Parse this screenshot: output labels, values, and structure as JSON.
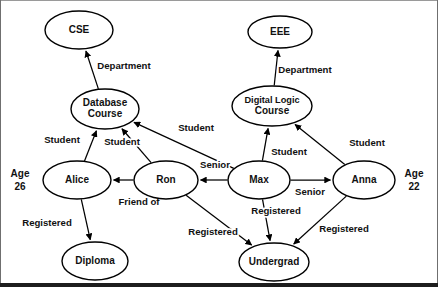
{
  "diagram": {
    "background_color": "#ffffff",
    "stroke_color": "#000000",
    "text_color": "#111111",
    "border_bottom_color": "#1d1d1d",
    "width": 438,
    "height": 298
  },
  "nodes": [
    {
      "id": "cse",
      "label": "CSE",
      "lines": [
        "CSE"
      ],
      "cx": 79,
      "cy": 30,
      "rx": 34,
      "ry": 19
    },
    {
      "id": "eee",
      "label": "EEE",
      "lines": [
        "EEE"
      ],
      "cx": 280,
      "cy": 32,
      "rx": 32,
      "ry": 16
    },
    {
      "id": "dbcourse",
      "label": "Database Course",
      "lines": [
        "Database",
        "Course"
      ],
      "cx": 105,
      "cy": 109,
      "rx": 34,
      "ry": 20
    },
    {
      "id": "dlcourse",
      "label": "Digital Logic Course",
      "lines": [
        "Digital Logic",
        "Course"
      ],
      "cx": 272,
      "cy": 106,
      "rx": 40,
      "ry": 20
    },
    {
      "id": "alice",
      "label": "Alice",
      "lines": [
        "Alice"
      ],
      "cx": 77,
      "cy": 180,
      "rx": 34,
      "ry": 19
    },
    {
      "id": "ron",
      "label": "Ron",
      "lines": [
        "Ron"
      ],
      "cx": 166,
      "cy": 180,
      "rx": 32,
      "ry": 19
    },
    {
      "id": "max",
      "label": "Max",
      "lines": [
        "Max"
      ],
      "cx": 259,
      "cy": 180,
      "rx": 31,
      "ry": 19
    },
    {
      "id": "anna",
      "label": "Anna",
      "lines": [
        "Anna"
      ],
      "cx": 364,
      "cy": 180,
      "rx": 31,
      "ry": 19
    },
    {
      "id": "diploma",
      "label": "Diploma",
      "lines": [
        "Diploma"
      ],
      "cx": 95,
      "cy": 261,
      "rx": 33,
      "ry": 19
    },
    {
      "id": "undergrad",
      "label": "Undergrad",
      "lines": [
        "Undergrad"
      ],
      "cx": 274,
      "cy": 262,
      "rx": 35,
      "ry": 19
    }
  ],
  "edges": [
    {
      "id": "e1",
      "from": "dbcourse",
      "to": "cse",
      "label": "Department",
      "label_x": 124,
      "label_y": 66,
      "directed": true
    },
    {
      "id": "e2",
      "from": "dlcourse",
      "to": "eee",
      "label": "Department",
      "label_x": 305,
      "label_y": 70,
      "directed": true
    },
    {
      "id": "e3",
      "from": "alice",
      "to": "dbcourse",
      "label": "Student",
      "label_x": 62,
      "label_y": 140,
      "directed": true
    },
    {
      "id": "e4",
      "from": "ron",
      "to": "dbcourse",
      "label": "Student",
      "label_x": 122,
      "label_y": 142,
      "directed": true
    },
    {
      "id": "e5",
      "from": "max",
      "to": "dbcourse",
      "label": "Student",
      "label_x": 196,
      "label_y": 128,
      "directed": true
    },
    {
      "id": "e6",
      "from": "max",
      "to": "dlcourse",
      "label": "Student",
      "label_x": 289,
      "label_y": 152,
      "directed": true
    },
    {
      "id": "e7",
      "from": "anna",
      "to": "dlcourse",
      "label": "Student",
      "label_x": 367,
      "label_y": 143,
      "directed": true
    },
    {
      "id": "e8",
      "from": "ron",
      "to": "alice",
      "label": "Friend of",
      "label_x": 139,
      "label_y": 202,
      "directed": true
    },
    {
      "id": "e9",
      "from": "max",
      "to": "ron",
      "label": "Senior",
      "label_x": 215,
      "label_y": 165,
      "directed": true
    },
    {
      "id": "e10",
      "from": "max",
      "to": "anna",
      "label": "Senior",
      "label_x": 310,
      "label_y": 192,
      "directed": true
    },
    {
      "id": "e11",
      "from": "alice",
      "to": "diploma",
      "label": "Registered",
      "label_x": 47,
      "label_y": 223,
      "directed": true
    },
    {
      "id": "e12",
      "from": "ron",
      "to": "undergrad",
      "label": "Registered",
      "label_x": 213,
      "label_y": 232,
      "directed": true
    },
    {
      "id": "e13",
      "from": "max",
      "to": "undergrad",
      "label": "Registered",
      "label_x": 276,
      "label_y": 211,
      "directed": true
    },
    {
      "id": "e14",
      "from": "anna",
      "to": "undergrad",
      "label": "Registered",
      "label_x": 344,
      "label_y": 229,
      "directed": true
    }
  ],
  "attributes": [
    {
      "id": "alice-age",
      "lines": [
        "Age",
        "26"
      ],
      "x": 20,
      "y": 174,
      "for_node": "alice"
    },
    {
      "id": "anna-age",
      "lines": [
        "Age",
        "22"
      ],
      "x": 414,
      "y": 174,
      "for_node": "anna"
    }
  ]
}
